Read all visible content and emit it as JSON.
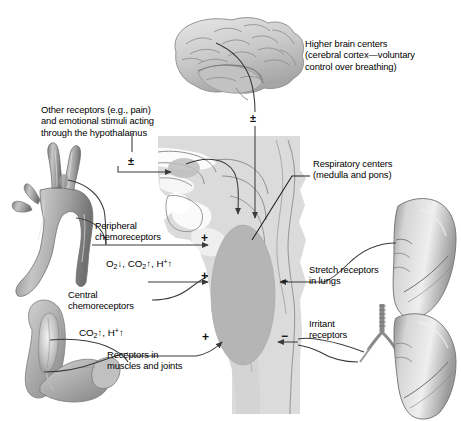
{
  "figure": {
    "background_color": "#ffffff",
    "ink_color": "#000000",
    "tissue_fill": "#d9d9d9",
    "medulla_fill": "#b5b5b5"
  },
  "labels": {
    "higher_brain_centers": "Higher brain centers\n(cerebral cortex—voluntary\ncontrol over breathing)",
    "other_receptors": "Other receptors (e.g., pain)\nand emotional stimuli acting\nthrough the hypothalamus",
    "respiratory_centers": "Respiratory centers\n(medulla and pons)",
    "peripheral_chemoreceptors": "Peripheral\nchemoreceptors",
    "central_chemoreceptors": "Central\nchemoreceptors",
    "stretch_receptors": "Stretch receptors\nin lungs",
    "irritant_receptors": "Irritant\nreceptors",
    "muscle_joint_receptors": "Receptors in\nmuscles and joints"
  },
  "formulas": {
    "peripheral": {
      "o2": "O",
      "o2_sub": "2",
      "o2_arrow": "↓",
      "sep1": ", ",
      "co2": "CO",
      "co2_sub": "2",
      "co2_arrow": "↑",
      "sep2": ", ",
      "h": "H",
      "h_sup": "+",
      "h_arrow": "↑"
    },
    "central": {
      "co2": "CO",
      "co2_sub": "2",
      "co2_arrow": "↑",
      "sep1": ", ",
      "h": "H",
      "h_sup": "+",
      "h_arrow": "↑"
    }
  },
  "signs": {
    "plus_minus_brain": "±",
    "plus_minus_hypothalamus": "±",
    "plus_peripheral": "+",
    "plus_central": "+",
    "plus_muscles": "+",
    "minus_stretch": "−",
    "minus_irritant": "−"
  },
  "anatomy": {
    "brain": "cerebral-cortex-lateral-view",
    "head_section": "midsagittal-head-and-neck-section",
    "medulla": "medulla-and-pons-oval",
    "carotid": "aortic-arch-and-carotid-bifurcation",
    "arm": "flexed-arm-with-biceps-muscle",
    "lung_upper": "right-lung-lateral",
    "lung_lower": "left-lung-with-trachea-and-bronchi"
  }
}
